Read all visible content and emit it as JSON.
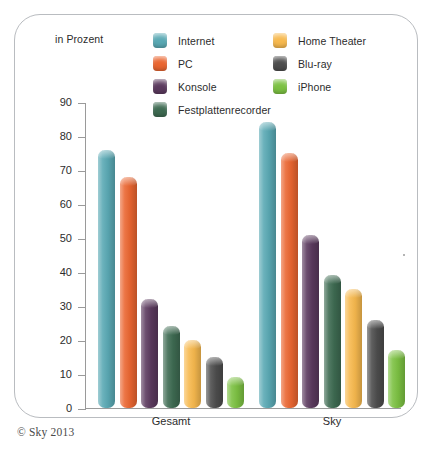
{
  "unit_label": "in Prozent",
  "copyright": "© Sky 2013",
  "legend": {
    "left_column": [
      {
        "label": "Internet",
        "color": "#5aa9b4",
        "icon": "legend-swatch-internet"
      },
      {
        "label": "PC",
        "color": "#ea6631",
        "icon": "legend-swatch-pc"
      },
      {
        "label": "Konsole",
        "color": "#5b3a5e",
        "icon": "legend-swatch-konsole"
      },
      {
        "label": "Festplattenrecorder",
        "color": "#3e6b52",
        "icon": "legend-swatch-festplattenrecorder"
      }
    ],
    "right_column": [
      {
        "label": "Home Theater",
        "color": "#f7b94e",
        "icon": "legend-swatch-home-theater"
      },
      {
        "label": "Blu-ray",
        "color": "#4d4d4d",
        "icon": "legend-swatch-bluray"
      },
      {
        "label": "iPhone",
        "color": "#7cc142",
        "icon": "legend-swatch-iphone"
      }
    ]
  },
  "chart_data": {
    "type": "bar",
    "title": "",
    "xlabel": "",
    "ylabel": "in Prozent",
    "ylim": [
      0,
      90
    ],
    "yticks": [
      0,
      10,
      20,
      30,
      40,
      50,
      60,
      70,
      80,
      90
    ],
    "grid": false,
    "legend_position": "top",
    "categories": [
      "Gesamt",
      "Sky"
    ],
    "series": [
      {
        "name": "Internet",
        "color": "#5aa9b4",
        "values": [
          76,
          84
        ]
      },
      {
        "name": "PC",
        "color": "#ea6631",
        "values": [
          68,
          75
        ]
      },
      {
        "name": "Konsole",
        "color": "#5b3a5e",
        "values": [
          32,
          51
        ]
      },
      {
        "name": "Festplattenrecorder",
        "color": "#3e6b52",
        "values": [
          24,
          39
        ]
      },
      {
        "name": "Home Theater",
        "color": "#f7b94e",
        "values": [
          20,
          35
        ]
      },
      {
        "name": "Blu-ray",
        "color": "#4d4d4d",
        "values": [
          15,
          26
        ]
      },
      {
        "name": "iPhone",
        "color": "#7cc142",
        "values": [
          9,
          17
        ]
      }
    ]
  }
}
